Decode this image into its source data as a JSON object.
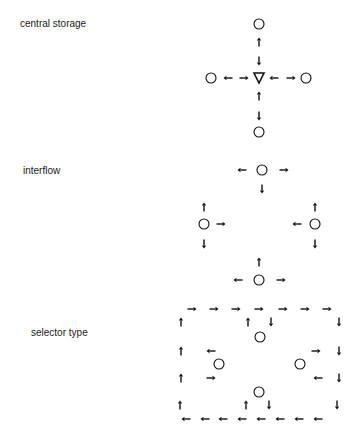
{
  "labels": {
    "central_storage": "central storage",
    "interflow": "interflow",
    "selector_type": "selector type"
  },
  "colors": {
    "stroke": "#111111",
    "background": "#ffffff"
  },
  "icons": {
    "node": "circle",
    "storage": "inverted-triangle",
    "flow": "arrow"
  },
  "panels": [
    {
      "name": "central-storage",
      "label_key": "central_storage",
      "circles": [
        [
          259,
          24
        ],
        [
          211,
          78
        ],
        [
          306,
          78
        ],
        [
          259,
          132
        ]
      ],
      "triangles": [
        [
          259,
          78
        ]
      ],
      "arrows": [
        [
          259,
          42,
          "up"
        ],
        [
          259,
          61,
          "down"
        ],
        [
          228,
          78,
          "left"
        ],
        [
          244,
          78,
          "right"
        ],
        [
          274,
          78,
          "left"
        ],
        [
          291,
          78,
          "right"
        ],
        [
          259,
          96,
          "up"
        ],
        [
          259,
          116,
          "down"
        ]
      ]
    },
    {
      "name": "interflow",
      "label_key": "interflow",
      "circles": [
        [
          262,
          170
        ],
        [
          204,
          224
        ],
        [
          315,
          224
        ],
        [
          259,
          280
        ]
      ],
      "triangles": [],
      "arrows": [
        [
          242,
          170,
          "left"
        ],
        [
          284,
          170,
          "right"
        ],
        [
          262,
          189,
          "down"
        ],
        [
          204,
          207,
          "up"
        ],
        [
          221,
          224,
          "right"
        ],
        [
          204,
          244,
          "down"
        ],
        [
          315,
          207,
          "up"
        ],
        [
          297,
          224,
          "left"
        ],
        [
          315,
          244,
          "down"
        ],
        [
          259,
          262,
          "up"
        ],
        [
          238,
          280,
          "left"
        ],
        [
          281,
          280,
          "right"
        ]
      ]
    },
    {
      "name": "selector-type",
      "label_key": "selector_type",
      "circles": [
        [
          260,
          337
        ],
        [
          219,
          364
        ],
        [
          300,
          364
        ],
        [
          259,
          392
        ]
      ],
      "triangles": [],
      "arrows": [
        [
          192,
          309,
          "right"
        ],
        [
          214,
          309,
          "right"
        ],
        [
          236,
          309,
          "right"
        ],
        [
          259,
          309,
          "right"
        ],
        [
          283,
          309,
          "right"
        ],
        [
          305,
          309,
          "right"
        ],
        [
          327,
          309,
          "right"
        ],
        [
          181,
          322,
          "up"
        ],
        [
          248,
          322,
          "up"
        ],
        [
          271,
          322,
          "down"
        ],
        [
          339,
          322,
          "down"
        ],
        [
          181,
          351,
          "up"
        ],
        [
          211,
          351,
          "left"
        ],
        [
          316,
          351,
          "right"
        ],
        [
          339,
          351,
          "down"
        ],
        [
          181,
          378,
          "up"
        ],
        [
          211,
          378,
          "right"
        ],
        [
          318,
          378,
          "left"
        ],
        [
          339,
          378,
          "down"
        ],
        [
          180,
          405,
          "up"
        ],
        [
          246,
          405,
          "up"
        ],
        [
          269,
          405,
          "down"
        ],
        [
          337,
          405,
          "down"
        ],
        [
          186,
          419,
          "left"
        ],
        [
          205,
          419,
          "left"
        ],
        [
          223,
          419,
          "left"
        ],
        [
          242,
          419,
          "left"
        ],
        [
          261,
          419,
          "left"
        ],
        [
          280,
          419,
          "left"
        ],
        [
          299,
          419,
          "left"
        ],
        [
          318,
          419,
          "left"
        ]
      ]
    }
  ]
}
